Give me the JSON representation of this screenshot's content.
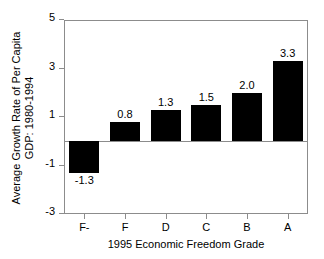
{
  "chart_data": {
    "type": "bar",
    "title": "",
    "categories": [
      "F-",
      "F",
      "D",
      "C",
      "B",
      "A"
    ],
    "values": [
      -1.3,
      0.8,
      1.3,
      1.5,
      2.0,
      3.3
    ],
    "data_labels": [
      "-1.3",
      "0.8",
      "1.3",
      "1.5",
      "2.0",
      "3.3"
    ],
    "xlabel": "1995 Economic Freedom Grade",
    "ylabel_line1": "Average Growth Rate of Per Capita",
    "ylabel_line2": "GDP: 1980-1994",
    "ylim": [
      -3,
      5
    ],
    "yticks": [
      5,
      3,
      1,
      -1,
      -3
    ],
    "ytick_labels": [
      "5",
      "3",
      "1",
      "-1",
      "-3"
    ],
    "grid": false,
    "legend": false,
    "bar_color": "#000000",
    "frame_color": "#8c8c8c",
    "background_color": "#ffffff"
  }
}
